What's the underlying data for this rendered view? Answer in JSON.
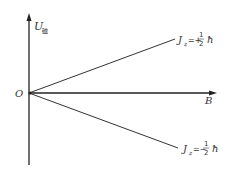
{
  "diagram": {
    "y_axis_label": "U",
    "y_axis_subscript": "磁",
    "origin_label": "O",
    "x_axis_label": "B",
    "lines": [
      {
        "name": "upper",
        "label_var": "J",
        "label_sub": "z",
        "label_sign": "=+",
        "label_num": "1",
        "label_den": "2",
        "label_unit": "ħ"
      },
      {
        "name": "lower",
        "label_var": "J",
        "label_sub": "z",
        "label_sign": "=−",
        "label_num": "1",
        "label_den": "2",
        "label_unit": "ħ"
      }
    ]
  }
}
